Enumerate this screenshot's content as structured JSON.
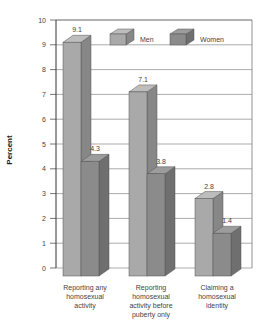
{
  "chart_data": {
    "type": "bar",
    "title": "",
    "xlabel": "",
    "ylabel": "Percent",
    "ylim": [
      0,
      10
    ],
    "yticks": [
      0,
      1,
      2,
      3,
      4,
      5,
      6,
      7,
      8,
      9,
      10
    ],
    "grid": true,
    "legend_position": "top-right inside",
    "categories": [
      "Reporting any homosexual activity",
      "Reporting homosexual activity before puberty only",
      "Claiming a homosexual identity"
    ],
    "category_lines": [
      [
        "Reporting any",
        "homosexual",
        "activity"
      ],
      [
        "Reporting",
        "homosexual",
        "activity before",
        "puberty only"
      ],
      [
        "Claiming a",
        "homosexual",
        "identity"
      ]
    ],
    "series": [
      {
        "name": "Men",
        "values": [
          9.1,
          7.1,
          2.8
        ],
        "labels": [
          "9.1",
          "7.1",
          "2.8"
        ],
        "color": "#a9a9a9"
      },
      {
        "name": "Women",
        "values": [
          4.3,
          3.8,
          1.4
        ],
        "labels": [
          "4.3",
          "3.8",
          "1.4"
        ],
        "color": "#8b8b8b"
      }
    ]
  }
}
